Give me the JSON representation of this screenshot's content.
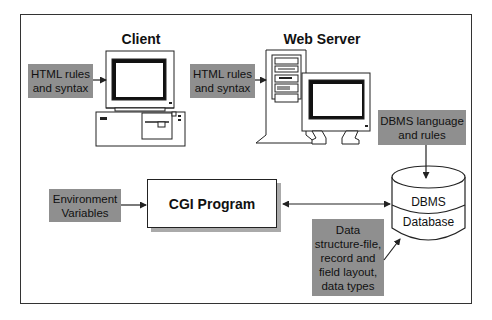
{
  "diagram": {
    "client": {
      "title": "Client",
      "input_box": {
        "lines": [
          "HTML rules",
          "and syntax"
        ]
      }
    },
    "web_server": {
      "title": "Web Server",
      "input_box": {
        "lines": [
          "HTML rules",
          "and syntax"
        ]
      }
    },
    "dbms_language_box": {
      "lines": [
        "DBMS language",
        "and rules"
      ]
    },
    "environment_box": {
      "lines": [
        "Environment",
        "Variables"
      ]
    },
    "cgi_program": {
      "label": "CGI Program"
    },
    "database": {
      "top_label": "DBMS",
      "bottom_label": "Database"
    },
    "data_structure_box": {
      "lines": [
        "Data",
        "structure-file,",
        "record and",
        "field layout,",
        "data types"
      ]
    },
    "colors": {
      "box_gray": "#8f8f8f",
      "line": "#222222",
      "shadow": "#aaaaaa"
    }
  }
}
